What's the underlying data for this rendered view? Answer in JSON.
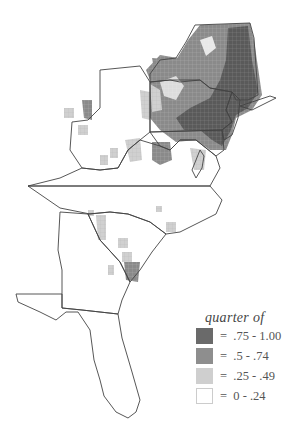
{
  "map": {
    "region": "Eastern United States (New York to Florida)",
    "states_outlined": [
      "New York",
      "Pennsylvania",
      "New Jersey",
      "Delaware",
      "Maryland",
      "West Virginia",
      "Virginia",
      "North Carolina",
      "South Carolina",
      "Georgia",
      "Florida"
    ],
    "fill_pattern": "grid cells shaded by class; densest in NY/PA/NJ/MD, sparse in VA/WV/SC, none in FL"
  },
  "legend": {
    "title": "quarter of",
    "items": [
      {
        "label": "=  .75 - 1.00",
        "color": "#6a6a6a"
      },
      {
        "label": "=  .5 - .74",
        "color": "#8e8e8e"
      },
      {
        "label": "=  .25 - .49",
        "color": "#cfcfcf"
      },
      {
        "label": "=  0 - .24",
        "color": "#ffffff"
      }
    ]
  },
  "colors": {
    "outline": "#444444",
    "dark": "#5f5f5f",
    "mid": "#8c8c8c",
    "light": "#c9c9c9"
  }
}
